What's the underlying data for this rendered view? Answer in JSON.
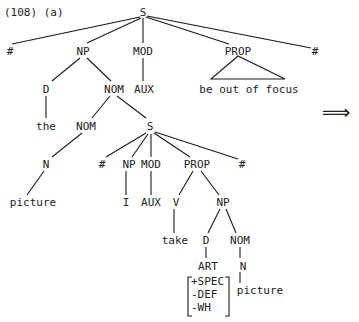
{
  "example_label": "(108) (a)",
  "arrow": "⟹",
  "nodes": {
    "s_root": "S",
    "hash_left": "#",
    "np_subj": "NP",
    "mod_main": "MOD",
    "prop_main": "PROP",
    "hash_right": "#",
    "prop_main_yield": "be out of focus",
    "d_subj": "D",
    "nom_subj": "NOM",
    "aux_main": "AUX",
    "the": "the",
    "nom_inner": "NOM",
    "s_rel": "S",
    "n_subj": "N",
    "hash_rel_left": "#",
    "np_rel": "NP",
    "mod_rel": "MOD",
    "prop_rel": "PROP",
    "hash_rel_right": "#",
    "picture_subj": "picture",
    "i": "I",
    "aux_rel": "AUX",
    "v_rel": "V",
    "np_obj": "NP",
    "take": "take",
    "d_obj": "D",
    "nom_obj": "NOM",
    "art": "ART",
    "n_obj": "N",
    "feat_spec": "+SPEC",
    "feat_def": "-DEF",
    "feat_wh": "-WH",
    "picture_obj": "picture"
  }
}
